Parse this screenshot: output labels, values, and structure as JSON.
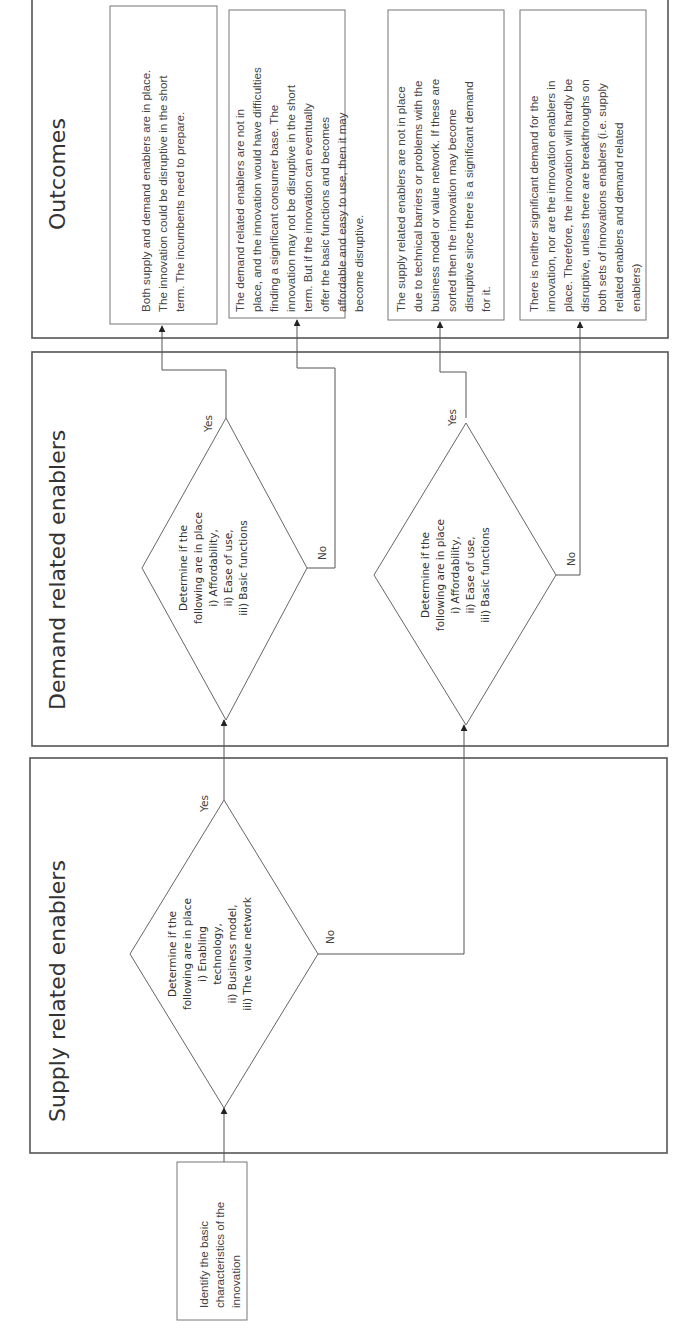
{
  "diagram": {
    "orientation": "rotated -90deg",
    "lanes": {
      "outcomes": {
        "title": "Outcomes"
      },
      "demand": {
        "title": "Demand related enablers"
      },
      "supply": {
        "title": "Supply related enablers"
      }
    },
    "start": {
      "lines": [
        "Identify the basic",
        "characteristics of the",
        "innovation"
      ]
    },
    "supply_decision": {
      "lines": [
        "Determine if the",
        "following are in place",
        "i) Enabling",
        "technology,",
        "ii) Business model,",
        "iii) The value network"
      ],
      "yes_label": "Yes",
      "no_label": "No"
    },
    "demand_decision_1": {
      "lines": [
        "Determine if the",
        "following are in place",
        "i) Affordability,",
        "ii) Ease of use,",
        "iii) Basic functions"
      ],
      "yes_label": "Yes",
      "no_label": "No"
    },
    "demand_decision_2": {
      "lines": [
        "Determine if the",
        "following are in place",
        "i) Affordability,",
        "ii) Ease of use,",
        "iii) Basic functions"
      ],
      "yes_label": "Yes",
      "no_label": "No"
    },
    "outcomes": [
      {
        "lines": [
          "Both supply and demand enablers are in place.",
          "The innovation could be disruptive in the short",
          "term. The incumbents need to prepare."
        ]
      },
      {
        "lines": [
          "The demand related enablers are not in",
          "place, and the innovation would have difficulties",
          "finding a significant consumer base. The",
          "innovation may not be disruptive in the short",
          "term. But if the innovation can eventually",
          "offer the basic functions and becomes",
          "affordable and easy to use, then it may",
          "become disruptive."
        ]
      },
      {
        "lines": [
          "The supply related enablers are not in place",
          "due to technical barriers or problems with the",
          "business model or value network. If these are",
          "sorted then the innovation may become",
          "disruptive since there is a significant demand",
          "for it."
        ]
      },
      {
        "lines": [
          "There is neither significant demand for the",
          "innovation, nor are the innovation enablers in",
          "place. Therefore, the innovation will hardly be",
          "disruptive, unless there are breakthroughs on",
          "both sets of innovations enablers (i.e. supply",
          "related enablers and demand related",
          "enablers)"
        ]
      }
    ]
  }
}
